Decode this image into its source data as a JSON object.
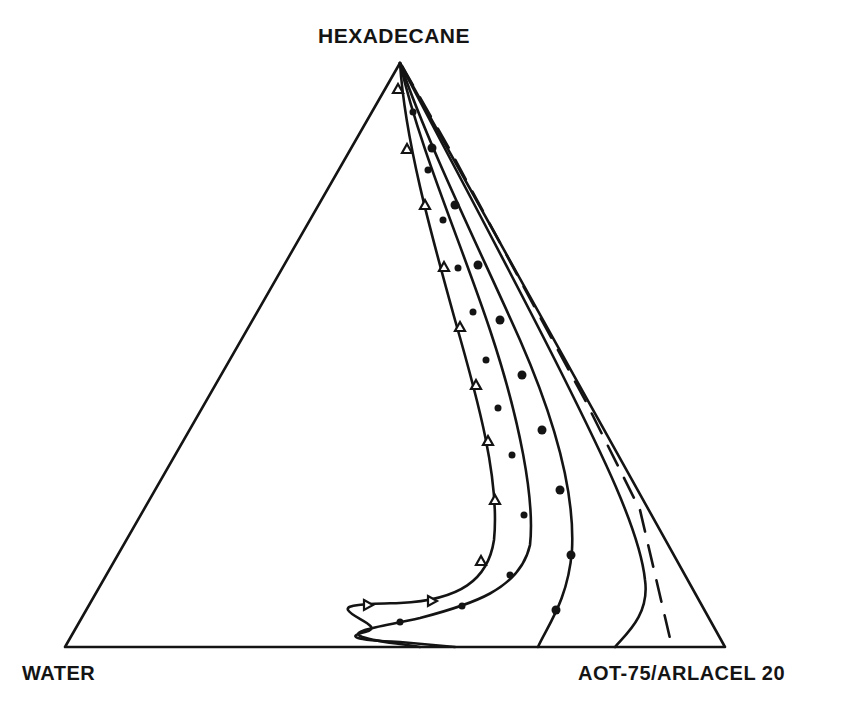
{
  "diagram": {
    "type": "ternary_phase_diagram",
    "vertices": {
      "top": "HEXADECANE",
      "bottom_left": "WATER",
      "bottom_right": "AOT-75/ARLACEL 20"
    },
    "curves": [
      {
        "name": "triangle-marker-curve",
        "marker": "triangle",
        "style": "solid"
      },
      {
        "name": "small-dot-curve-1",
        "marker": "small-dot",
        "style": "solid"
      },
      {
        "name": "large-dot-curve",
        "marker": "dot",
        "style": "solid"
      },
      {
        "name": "dot-curve-outer",
        "marker": "dash-dot",
        "style": "solid"
      },
      {
        "name": "dashed-curve",
        "marker": "none",
        "style": "dashed"
      }
    ],
    "colors": {
      "line": "#141414",
      "background": "#ffffff"
    }
  }
}
